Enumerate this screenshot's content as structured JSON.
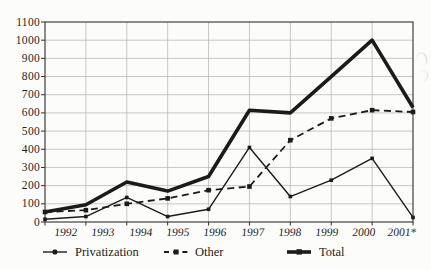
{
  "chart_data": {
    "type": "line",
    "title": "",
    "xlabel": "",
    "ylabel": "",
    "categories": [
      "1992",
      "1993",
      "1994",
      "1995",
      "1996",
      "1997",
      "1998",
      "1999",
      "2000",
      "2001*"
    ],
    "series": [
      {
        "name": "Privatization",
        "values": [
          15,
          30,
          135,
          30,
          70,
          410,
          140,
          230,
          350,
          25
        ],
        "line_style": "solid",
        "line_width": 1.4,
        "marker": "square",
        "marker_size": 3.6
      },
      {
        "name": "Other",
        "values": [
          55,
          65,
          100,
          130,
          175,
          195,
          450,
          570,
          615,
          605
        ],
        "line_style": "dashed",
        "line_width": 1.8,
        "marker": "square",
        "marker_size": 4.6
      },
      {
        "name": "Total",
        "values": [
          55,
          95,
          220,
          170,
          250,
          615,
          600,
          800,
          1000,
          630
        ],
        "line_style": "solid",
        "line_width": 3.6,
        "marker": "none",
        "marker_size": 0
      }
    ],
    "ylim": [
      0,
      1100
    ],
    "ytick_step": 100,
    "yticks": [
      "0",
      "100",
      "200",
      "300",
      "400",
      "500",
      "600",
      "700",
      "800",
      "900",
      "1000",
      "1100"
    ],
    "grid": true,
    "legend_position": "bottom",
    "ink_color": "#1b1b1b",
    "grid_color": "#b6b6b6"
  }
}
